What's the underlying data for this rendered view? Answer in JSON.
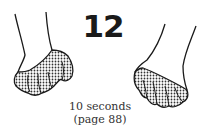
{
  "figure": {
    "number": "12",
    "caption_line1": "10 seconds",
    "caption_line2": "(page 88)",
    "illustrations": [
      {
        "name": "left-hand",
        "description": "left hand with curled fingers, dotted shading"
      },
      {
        "name": "right-hand",
        "description": "right hand with curled fingers, dotted shading"
      }
    ],
    "colors": {
      "ink": "#1a1a1a",
      "background": "#ffffff"
    }
  }
}
